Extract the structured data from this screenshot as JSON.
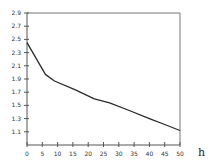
{
  "chart_data": {
    "type": "line",
    "title": "",
    "xlabel": "h",
    "ylabel": "",
    "xlim": [
      0,
      50
    ],
    "ylim": [
      0.9,
      2.9
    ],
    "grid": false,
    "legend": null,
    "x_ticks": [
      0,
      5,
      10,
      15,
      20,
      25,
      30,
      35,
      40,
      45,
      50
    ],
    "y_ticks": [
      1.1,
      1.3,
      1.5,
      1.7,
      1.9,
      2.1,
      2.3,
      2.5,
      2.7,
      2.9
    ],
    "x_tick_labels": [
      "0",
      "5",
      "10",
      "15",
      "20",
      "25",
      "30",
      "35",
      "40",
      "45",
      "50"
    ],
    "y_tick_labels": [
      "1.1",
      "1.3",
      "1.5",
      "1.7",
      "1.9",
      "2.1",
      "2.3",
      "2.5",
      "2.7",
      "2.9"
    ],
    "series": [
      {
        "name": "curve",
        "x": [
          0,
          6,
          9,
          16,
          22,
          27,
          33,
          40,
          45,
          50
        ],
        "y": [
          2.45,
          1.97,
          1.87,
          1.73,
          1.6,
          1.54,
          1.43,
          1.3,
          1.21,
          1.12
        ]
      }
    ]
  },
  "labels": {
    "x_unit": "h"
  },
  "colors": {
    "line": "#2a2a2a",
    "axis": "#555555",
    "frame": "#777777"
  }
}
